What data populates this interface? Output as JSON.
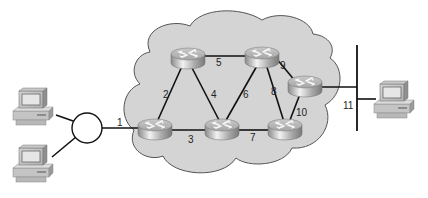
{
  "diagram": {
    "type": "network-topology",
    "colors": {
      "background": "#ffffff",
      "cloud_fill": "#d4d4d4",
      "cloud_stroke": "#555555",
      "link": "#111111",
      "router_body": "#b8b8b8",
      "hub_fill": "#ffffff"
    },
    "nodes": [
      {
        "id": "pc-left-top",
        "kind": "workstation"
      },
      {
        "id": "pc-left-bottom",
        "kind": "workstation"
      },
      {
        "id": "hub",
        "kind": "hub"
      },
      {
        "id": "router-1",
        "kind": "router",
        "position": "bottom-left"
      },
      {
        "id": "router-2",
        "kind": "router",
        "position": "top-left"
      },
      {
        "id": "router-3",
        "kind": "router",
        "position": "top-right"
      },
      {
        "id": "router-4",
        "kind": "router",
        "position": "bottom-middle"
      },
      {
        "id": "router-5",
        "kind": "router",
        "position": "bottom-right"
      },
      {
        "id": "router-6",
        "kind": "router",
        "position": "right"
      },
      {
        "id": "bus",
        "kind": "ethernet-bus"
      },
      {
        "id": "pc-right",
        "kind": "workstation"
      }
    ],
    "links": [
      {
        "label": "1",
        "from": "hub",
        "to": "router-1"
      },
      {
        "label": "2",
        "from": "router-1",
        "to": "router-2"
      },
      {
        "label": "3",
        "from": "router-1",
        "to": "router-4"
      },
      {
        "label": "4",
        "from": "router-2",
        "to": "router-4"
      },
      {
        "label": "5",
        "from": "router-2",
        "to": "router-3"
      },
      {
        "label": "6",
        "from": "router-3",
        "to": "router-4"
      },
      {
        "label": "7",
        "from": "router-4",
        "to": "router-5"
      },
      {
        "label": "8",
        "from": "router-3",
        "to": "router-5"
      },
      {
        "label": "9",
        "from": "router-3",
        "to": "router-6"
      },
      {
        "label": "10",
        "from": "router-5",
        "to": "router-6"
      },
      {
        "label": "11",
        "from": "router-6",
        "to": "bus"
      }
    ]
  }
}
